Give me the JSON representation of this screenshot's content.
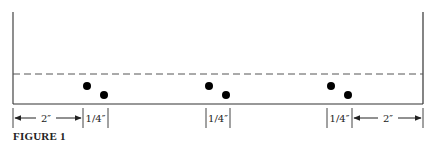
{
  "figure": {
    "caption": "FIGURE 1",
    "colors": {
      "line": "#333333",
      "dot": "#000000",
      "dash": "#555555",
      "text": "#222222"
    },
    "frame": {
      "left_x": 13,
      "right_x": 423,
      "top_y": 12,
      "base_y": 104
    },
    "dashed_line": {
      "y": 74
    },
    "dot_pairs": [
      {
        "name": "left-pair",
        "dots": [
          {
            "cx": 87,
            "cy": 86
          },
          {
            "cx": 104,
            "cy": 95
          }
        ]
      },
      {
        "name": "middle-pair",
        "dots": [
          {
            "cx": 209,
            "cy": 86
          },
          {
            "cx": 226,
            "cy": 95
          }
        ]
      },
      {
        "name": "right-pair",
        "dots": [
          {
            "cx": 331,
            "cy": 86
          },
          {
            "cx": 348,
            "cy": 95
          }
        ]
      }
    ],
    "dimensions": {
      "left_span": "2″",
      "left_gap": "1/4″",
      "middle_gap": "1/4″",
      "right_gap": "1/4″",
      "right_span": "2″"
    }
  }
}
